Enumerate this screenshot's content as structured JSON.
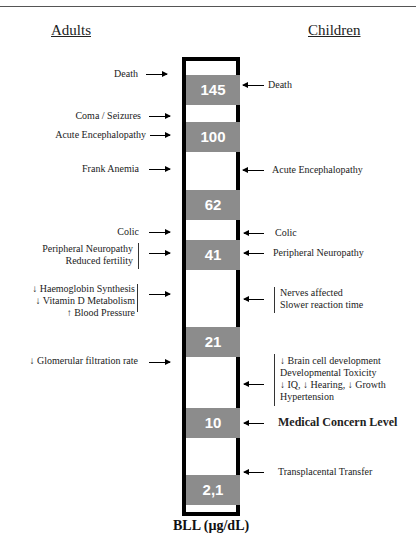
{
  "headings": {
    "adults": "Adults",
    "children": "Children"
  },
  "axis_label": "BLL (µg/dL)",
  "levels": [
    {
      "value": "145",
      "top": 14
    },
    {
      "value": "100",
      "top": 61
    },
    {
      "value": "62",
      "top": 129
    },
    {
      "value": "41",
      "top": 179
    },
    {
      "value": "21",
      "top": 266
    },
    {
      "value": "10",
      "top": 347
    },
    {
      "value": "2,1",
      "top": 414
    }
  ],
  "adults": [
    {
      "lines": [
        "Death"
      ],
      "level_bll": "145"
    },
    {
      "lines": [
        "Coma / Seizures"
      ],
      "level_bll": "100"
    },
    {
      "lines": [
        "Acute Encephalopathy"
      ],
      "level_bll": "100"
    },
    {
      "lines": [
        "Frank Anemia"
      ],
      "level_bll": "62"
    },
    {
      "lines": [
        "Colic"
      ],
      "level_bll": "41"
    },
    {
      "lines": [
        "Peripheral Neuropathy",
        "Reduced fertility"
      ],
      "level_bll": "41"
    },
    {
      "lines": [
        "↓ Haemoglobin Synthesis",
        "↓ Vitamin D Metabolism",
        "↑ Blood Pressure"
      ],
      "level_bll": "21"
    },
    {
      "lines": [
        "↓ Glomerular filtration rate"
      ],
      "level_bll": "10"
    }
  ],
  "children": [
    {
      "lines": [
        "Death"
      ],
      "level_bll": "145"
    },
    {
      "lines": [
        "Acute Encephalopathy"
      ],
      "level_bll": "62"
    },
    {
      "lines": [
        "Colic"
      ],
      "level_bll": "41"
    },
    {
      "lines": [
        "Peripheral Neuropathy"
      ],
      "level_bll": "41"
    },
    {
      "lines": [
        "Nerves affected",
        "Slower reaction time"
      ],
      "level_bll": "21"
    },
    {
      "lines": [
        "↓ Brain cell development",
        "Developmental Toxicity",
        "↓ IQ, ↓ Hearing, ↓ Growth",
        "Hypertension"
      ],
      "level_bll": "10"
    },
    {
      "lines": [
        "Medical Concern Level"
      ],
      "level_bll": "10"
    },
    {
      "lines": [
        "Transplacental Transfer"
      ],
      "level_bll": "2,1"
    }
  ],
  "colors": {
    "box_fill": "#8c8c8c",
    "box_text": "#ffffff",
    "column_border": "#000000"
  }
}
